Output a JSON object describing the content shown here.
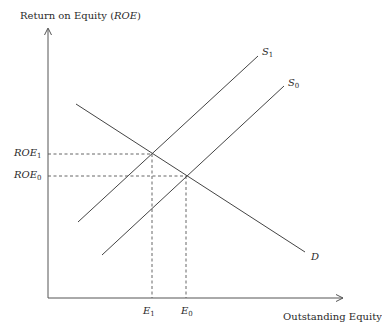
{
  "diagram": {
    "y_axis_label": {
      "text": "Return on Equity (",
      "var": "ROE",
      "close": ")"
    },
    "x_axis_label": "Outstanding Equity",
    "curves": [
      {
        "id": "D",
        "name": "D",
        "sub": "",
        "type": "demand"
      },
      {
        "id": "S0",
        "name": "S",
        "sub": "0",
        "type": "supply"
      },
      {
        "id": "S1",
        "name": "S",
        "sub": "1",
        "type": "supply"
      }
    ],
    "y_ticks": [
      {
        "name": "ROE",
        "sub": "1"
      },
      {
        "name": "ROE",
        "sub": "0"
      }
    ],
    "x_ticks": [
      {
        "name": "E",
        "sub": "1"
      },
      {
        "name": "E",
        "sub": "0"
      }
    ],
    "equilibria": [
      {
        "label": "E1/ROE1",
        "curves": [
          "D",
          "S1"
        ]
      },
      {
        "label": "E0/ROE0",
        "curves": [
          "D",
          "S0"
        ]
      }
    ],
    "colors": {
      "line": "#3a3a3a",
      "text": "#2a2a2a",
      "background": "#ffffff"
    }
  }
}
